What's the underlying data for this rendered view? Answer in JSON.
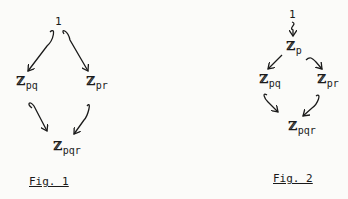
{
  "figures": [
    {
      "caption": "Fig. 1",
      "nodes": {
        "top": {
          "main": "1"
        },
        "left": {
          "main": "ℤ",
          "sub": "pq"
        },
        "right": {
          "main": "ℤ",
          "sub": "pr"
        },
        "bottom": {
          "main": "ℤ",
          "sub": "pqr"
        }
      },
      "edges": [
        [
          "1",
          "ℤpq"
        ],
        [
          "1",
          "ℤpr"
        ],
        [
          "ℤpq",
          "ℤpqr"
        ],
        [
          "ℤpr",
          "ℤpqr"
        ]
      ]
    },
    {
      "caption": "Fig. 2",
      "nodes": {
        "top": {
          "main": "1"
        },
        "mid": {
          "main": "ℤ",
          "sub": "p"
        },
        "left": {
          "main": "ℤ",
          "sub": "pq"
        },
        "right": {
          "main": "ℤ",
          "sub": "pr"
        },
        "bottom": {
          "main": "ℤ",
          "sub": "pqr"
        }
      },
      "edges": [
        [
          "1",
          "ℤp"
        ],
        [
          "ℤp",
          "ℤpq"
        ],
        [
          "ℤp",
          "ℤpr"
        ],
        [
          "ℤpq",
          "ℤpqr"
        ],
        [
          "ℤpr",
          "ℤpqr"
        ]
      ]
    }
  ]
}
